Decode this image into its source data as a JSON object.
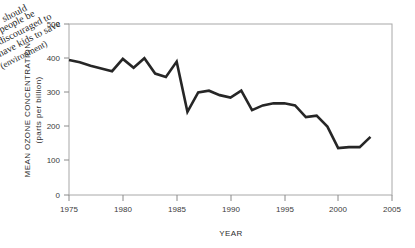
{
  "annotation": {
    "text_lines": [
      "should",
      "people be",
      "discouraged to",
      "have kids to save",
      "(environment)"
    ]
  },
  "chart_data": {
    "type": "line",
    "title": "",
    "xlabel": "YEAR",
    "ylabel": "MEAN OZONE CONCENTRATION (parts per billion)",
    "ylabel_line1": "MEAN OZONE CONCENTRATION",
    "ylabel_line2": "(parts per billion)",
    "xlim": [
      1975,
      2005
    ],
    "ylim": [
      0,
      500
    ],
    "xticks": [
      1975,
      1980,
      1985,
      1990,
      1995,
      2000,
      2005
    ],
    "yticks": [
      0,
      100,
      200,
      300,
      400,
      500
    ],
    "grid": false,
    "legend": "none",
    "series": [
      {
        "name": "Mean ozone concentration",
        "x": [
          1975,
          1976,
          1977,
          1978,
          1979,
          1980,
          1981,
          1982,
          1983,
          1984,
          1985,
          1986,
          1987,
          1988,
          1989,
          1990,
          1991,
          1992,
          1993,
          1994,
          1995,
          1996,
          1997,
          1998,
          1999,
          2000,
          2001,
          2002,
          2003
        ],
        "values": [
          395,
          388,
          378,
          370,
          362,
          398,
          372,
          400,
          355,
          345,
          390,
          243,
          300,
          305,
          292,
          285,
          305,
          248,
          262,
          268,
          268,
          262,
          228,
          232,
          200,
          137,
          140,
          140,
          170
        ]
      }
    ]
  }
}
